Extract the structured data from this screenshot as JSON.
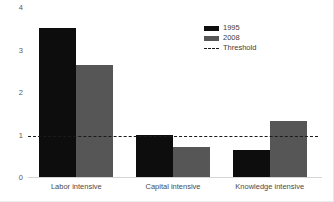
{
  "chart_data": {
    "type": "bar",
    "title": "",
    "xlabel": "",
    "ylabel": "",
    "ylim": [
      0,
      4
    ],
    "yticks": [
      "0",
      "1",
      "2",
      "3",
      "4"
    ],
    "grid": false,
    "legend_position": "top-right",
    "categories": [
      "Labor intensive",
      "Capital intensive",
      "Knowledge intensive"
    ],
    "series": [
      {
        "name": "1995",
        "color": "#0d0d0d",
        "values": [
          3.52,
          1.02,
          0.65
        ]
      },
      {
        "name": "2008",
        "color": "#565656",
        "values": [
          2.65,
          0.72,
          1.35
        ]
      }
    ],
    "annotations": [
      {
        "name": "Threshold",
        "type": "hline",
        "value": 1.0,
        "style": "dashed",
        "color": "#1a1a1a"
      }
    ]
  },
  "legend": {
    "entries": [
      {
        "label": "1995",
        "marker": "solid-swatch"
      },
      {
        "label": "2008",
        "marker": "solid-swatch"
      },
      {
        "label": "Threshold",
        "marker": "dashed-line"
      }
    ]
  },
  "axes": {
    "y_ticks": [
      "4",
      "3",
      "2",
      "1",
      "0"
    ],
    "x_categories": [
      "Labor intensive",
      "Capital intensive",
      "Knowledge intensive"
    ]
  },
  "title_strip": ""
}
